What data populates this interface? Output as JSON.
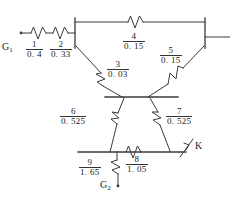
{
  "figure": {
    "type": "electrical-impedance-diagram",
    "title_partial": "",
    "generators": [
      {
        "id": "G1",
        "label": "G",
        "subscript": "1"
      },
      {
        "id": "G2",
        "label": "G",
        "subscript": "2"
      }
    ],
    "fault": {
      "label": "K"
    },
    "branches": [
      {
        "index": "1",
        "value": "0. 4",
        "num": "1",
        "den": "0. 4"
      },
      {
        "index": "2",
        "value": "0. 33",
        "num": "2",
        "den": "0. 33"
      },
      {
        "index": "3",
        "value": "0. 03",
        "num": "3",
        "den": "0. 03"
      },
      {
        "index": "4",
        "value": "0. 15",
        "num": "4",
        "den": "0. 15"
      },
      {
        "index": "5",
        "value": "0. 15",
        "num": "5",
        "den": "0. 15"
      },
      {
        "index": "6",
        "value": "0. 525",
        "num": "6",
        "den": "0. 525"
      },
      {
        "index": "7",
        "value": "0. 525",
        "num": "7",
        "den": "0. 525"
      },
      {
        "index": "8",
        "value": "1. 05",
        "num": "8",
        "den": "1. 05"
      },
      {
        "index": "9",
        "value": "1. 65",
        "num": "9",
        "den": "1. 65"
      }
    ],
    "colors": {
      "line": "#3a3a3a",
      "text": "#1a1a1a",
      "background": "#ffffff",
      "faded_header": "#b9b9b9"
    }
  }
}
